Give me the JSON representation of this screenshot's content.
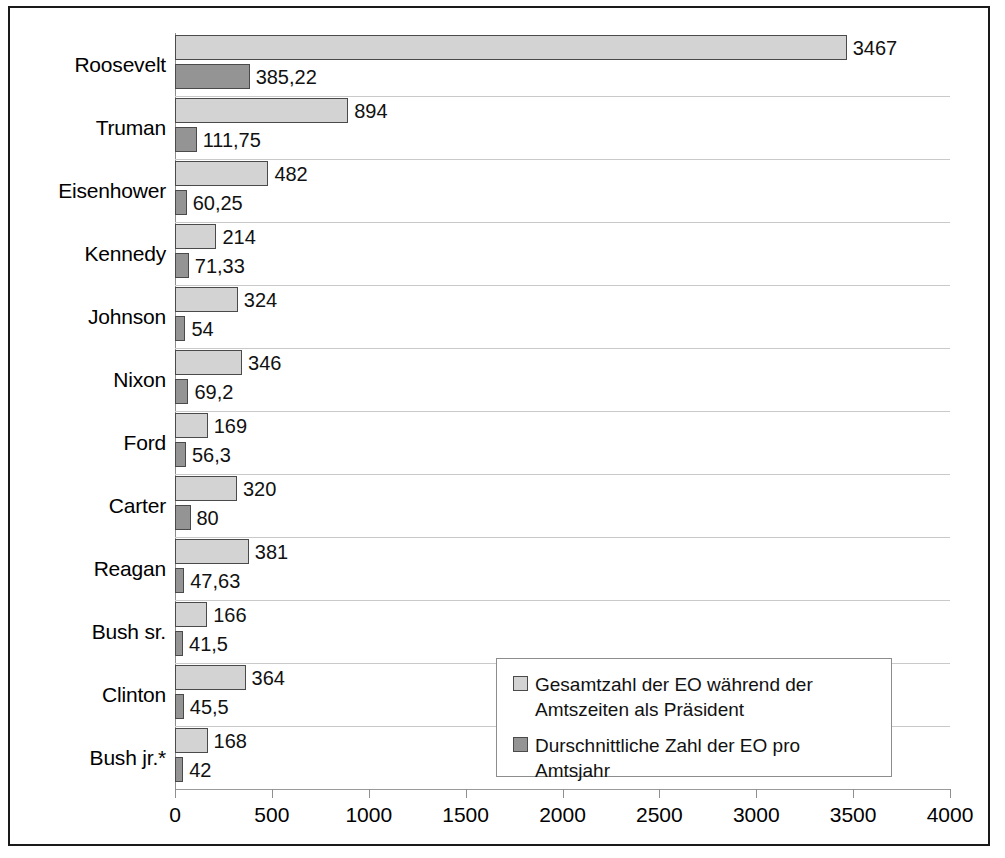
{
  "chart_data": {
    "type": "bar",
    "orientation": "horizontal",
    "title": "",
    "subtitle": "",
    "xlabel": "",
    "ylabel": "",
    "xlim": [
      0,
      4000
    ],
    "xticks": [
      "0",
      "500",
      "1000",
      "1500",
      "2000",
      "2500",
      "3000",
      "3500",
      "4000"
    ],
    "xtick_values": [
      0,
      500,
      1000,
      1500,
      2000,
      2500,
      3000,
      3500,
      4000
    ],
    "grid": "horizontal-category-separators",
    "legend_position": "inside-bottom-right",
    "categories": [
      "Roosevelt",
      "Truman",
      "Eisenhower",
      "Kennedy",
      "Johnson",
      "Nixon",
      "Ford",
      "Carter",
      "Reagan",
      "Bush sr.",
      "Clinton",
      "Bush jr.*"
    ],
    "series": [
      {
        "name": "Gesamtzahl der EO während der Amtszeiten als Präsident",
        "color": "#d3d3d3",
        "values": [
          3467,
          894,
          482,
          214,
          324,
          346,
          169,
          320,
          381,
          166,
          364,
          168
        ],
        "labels": [
          "3467",
          "894",
          "482",
          "214",
          "324",
          "346",
          "169",
          "320",
          "381",
          "166",
          "364",
          "168"
        ]
      },
      {
        "name": "Durschnittliche Zahl der EO pro Amtsjahr",
        "color": "#949494",
        "values": [
          385.22,
          111.75,
          60.25,
          71.33,
          54,
          69.2,
          56.3,
          80,
          47.63,
          41.5,
          45.5,
          42
        ],
        "labels": [
          "385,22",
          "111,75",
          "60,25",
          "71,33",
          "54",
          "69,2",
          "56,3",
          "80",
          "47,63",
          "41,5",
          "45,5",
          "42"
        ]
      }
    ]
  },
  "legend": {
    "entries": [
      {
        "label": "Gesamtzahl der EO während der Amtszeiten als Präsident",
        "swatch": "total"
      },
      {
        "label": "Durschnittliche Zahl der EO pro Amtsjahr",
        "swatch": "avg"
      }
    ]
  },
  "colors": {
    "series_total": "#d3d3d3",
    "series_avg": "#949494",
    "bar_border": "#4a4a4a",
    "grid": "#c9c9c9",
    "frame": "#1a1a1a"
  }
}
